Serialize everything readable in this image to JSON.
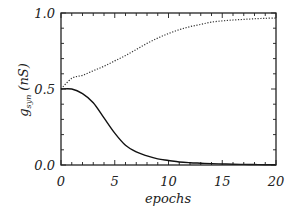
{
  "chart_data": {
    "type": "line",
    "title": "",
    "xlabel": "epochs",
    "ylabel": "g_syn (nS)",
    "ylabel_main": "g",
    "ylabel_sub": "syn",
    "ylabel_unit": "(nS)",
    "xlim": [
      0,
      20
    ],
    "ylim": [
      0.0,
      1.0
    ],
    "xticks": [
      0,
      5,
      10,
      15,
      20
    ],
    "xtick_labels": [
      "0",
      "5",
      "10",
      "15",
      "20"
    ],
    "yticks": [
      0.0,
      0.5,
      1.0
    ],
    "ytick_labels": [
      "0.0",
      "0.5",
      "1.0"
    ],
    "x_minor_step": 1,
    "y_minor_step": 0.1,
    "grid": false,
    "legend": null,
    "x": [
      0,
      1,
      2,
      3,
      4,
      5,
      6,
      7,
      8,
      9,
      10,
      11,
      12,
      13,
      14,
      15,
      16,
      17,
      18,
      19,
      20
    ],
    "series": [
      {
        "name": "upper (dotted)",
        "style": "dotted",
        "color": "#333333",
        "values": [
          0.5,
          0.57,
          0.59,
          0.62,
          0.65,
          0.685,
          0.72,
          0.76,
          0.8,
          0.835,
          0.865,
          0.89,
          0.91,
          0.925,
          0.94,
          0.948,
          0.954,
          0.958,
          0.962,
          0.965,
          0.967
        ]
      },
      {
        "name": "lower (solid)",
        "style": "solid",
        "color": "#111111",
        "values": [
          0.5,
          0.5,
          0.47,
          0.41,
          0.31,
          0.21,
          0.13,
          0.086,
          0.06,
          0.04,
          0.03,
          0.02,
          0.015,
          0.012,
          0.009,
          0.007,
          0.005,
          0.004,
          0.003,
          0.002,
          0.002
        ]
      }
    ]
  }
}
